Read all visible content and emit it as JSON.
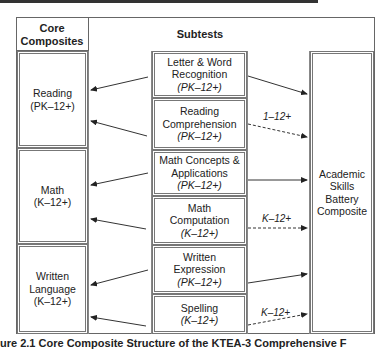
{
  "header": {
    "left_title_line1": "Core",
    "left_title_line2": "Composites",
    "middle_title": "Subtests"
  },
  "core_composites": [
    {
      "name": "Reading",
      "range": "(PK–12+)"
    },
    {
      "name": "Math",
      "range": "(K–12+)"
    },
    {
      "name_line1": "Written",
      "name_line2": "Language",
      "range": "(K–12+)"
    }
  ],
  "subtests": [
    {
      "line1": "Letter & Word",
      "line2": "Recognition",
      "range": "(PK–12+)"
    },
    {
      "line1": "Reading",
      "line2": "Comprehension",
      "range": "(PK–12+)"
    },
    {
      "line1": "Math Concepts &",
      "line2": "Applications",
      "range": "(PK–12+)"
    },
    {
      "line1": "Math",
      "line2": "Computation",
      "range": "(K–12+)"
    },
    {
      "line1": "Written",
      "line2": "Expression",
      "range": "(PK–12+)"
    },
    {
      "line1": "Spelling",
      "range": "(K–12+)"
    }
  ],
  "battery": {
    "line1": "Academic",
    "line2": "Skills",
    "line3": "Battery",
    "line4": "Composite"
  },
  "arrow_labels": {
    "reading_comp": "1–12+",
    "math_comp": "K–12+",
    "spelling": "K–12+"
  },
  "caption": "ure 2.1 Core Composite Structure of the KTEA-3 Comprehensive F"
}
